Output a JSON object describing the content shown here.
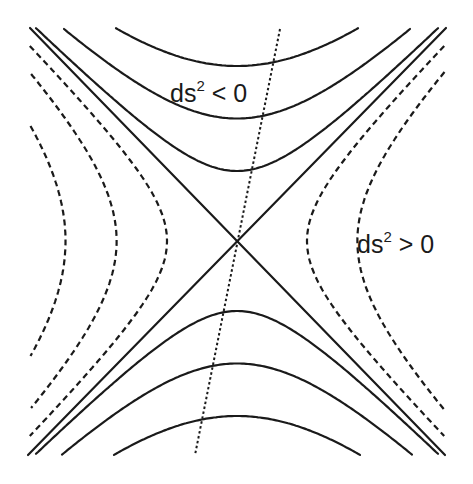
{
  "diagram": {
    "labels": {
      "timelike": {
        "base": "ds",
        "exp": "2",
        "rel": " < 0"
      },
      "spacelike": {
        "base": "ds",
        "exp": "2",
        "rel": " > 0"
      }
    },
    "light_cone": {
      "description": "two crossing null lines (asymptotes)",
      "style": "solid"
    },
    "timelike_hyperbolas": {
      "style": "solid",
      "branches": [
        "upper",
        "lower"
      ],
      "semi_axes": [
        1.0,
        1.75,
        2.5
      ]
    },
    "spacelike_hyperbolas": {
      "style": "dashed",
      "left_semi_axes": [
        1.0,
        1.72,
        2.45
      ],
      "right_semi_axes": [
        1.0,
        1.72
      ]
    },
    "boosted_axis": {
      "style": "dotted",
      "description": "tilted time axis of a moving observer"
    },
    "colors": {
      "ink": "#1a1a1a",
      "background": "#ffffff"
    }
  }
}
